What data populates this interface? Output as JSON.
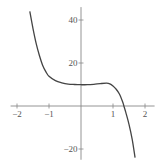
{
  "chart_data": {
    "type": "line",
    "title": "",
    "xlabel": "",
    "ylabel": "",
    "xlim": [
      -2.2,
      2.3
    ],
    "ylim": [
      -25,
      46
    ],
    "grid": false,
    "x_ticks": [
      -2,
      -1,
      1,
      2
    ],
    "x_tick_labels": [
      "−2",
      "−1",
      "1",
      "2"
    ],
    "y_ticks": [
      40,
      20,
      -20
    ],
    "y_tick_labels": [
      "40",
      "20",
      "−20"
    ],
    "series": [
      {
        "name": "f(x)",
        "color": "#444444",
        "x": [
          -1.6,
          -1.5,
          -1.4,
          -1.3,
          -1.2,
          -1.1,
          -1.0,
          -0.8,
          -0.6,
          -0.4,
          -0.2,
          0.0,
          0.2,
          0.4,
          0.6,
          0.8,
          0.9,
          1.0,
          1.1,
          1.2,
          1.3,
          1.34,
          1.4,
          1.5,
          1.6,
          1.69
        ],
        "y": [
          44,
          36,
          29,
          23.5,
          19,
          16,
          13.8,
          11.8,
          10.8,
          10.2,
          10.0,
          9.9,
          9.9,
          10.1,
          10.4,
          10.6,
          10.3,
          9.3,
          7.8,
          5.6,
          2.0,
          0,
          -3,
          -8.5,
          -15.5,
          -24
        ]
      }
    ]
  }
}
